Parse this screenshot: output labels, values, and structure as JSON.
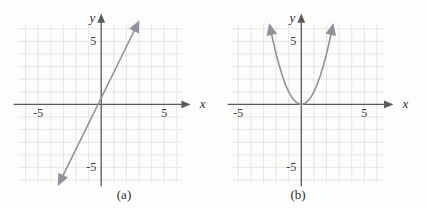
{
  "colors": {
    "background": "#fdfdfc",
    "grid": "#e4e7e3",
    "axis": "#5a5a5a",
    "curve": "#90939a",
    "text": "#3a3a3a"
  },
  "chart_data": [
    {
      "type": "line",
      "caption": "(a)",
      "title": "",
      "xlabel": "x",
      "ylabel": "y",
      "xlim": [
        -6.6,
        6.4
      ],
      "ylim": [
        -6.2,
        6.3
      ],
      "xticks": [
        -5,
        5
      ],
      "yticks": [
        5,
        -5
      ],
      "grid": true,
      "legend": "none",
      "arrows": "both-ends",
      "approx_equation": "y = 2x + 0.5",
      "points": [
        [
          -3.35,
          -6.3
        ],
        [
          2.95,
          6.5
        ]
      ]
    },
    {
      "type": "line",
      "curve_shape": "parabola",
      "caption": "(b)",
      "title": "",
      "xlabel": "x",
      "ylabel": "y",
      "xlim": [
        -5.5,
        6.6
      ],
      "ylim": [
        -6.2,
        6.3
      ],
      "xticks": [
        -5,
        5
      ],
      "yticks": [
        5,
        -5
      ],
      "grid": true,
      "legend": "none",
      "arrows": "both-ends",
      "approx_equation": "y = x^2",
      "points": [
        [
          -2.5,
          6.25
        ],
        [
          -2.25,
          5.06
        ],
        [
          -2,
          4
        ],
        [
          -1.75,
          3.06
        ],
        [
          -1.5,
          2.25
        ],
        [
          -1.25,
          1.56
        ],
        [
          -1,
          1
        ],
        [
          -0.75,
          0.56
        ],
        [
          -0.5,
          0.25
        ],
        [
          -0.25,
          0.06
        ],
        [
          0,
          0
        ],
        [
          0.25,
          0.06
        ],
        [
          0.5,
          0.25
        ],
        [
          0.75,
          0.56
        ],
        [
          1,
          1
        ],
        [
          1.25,
          1.56
        ],
        [
          1.5,
          2.25
        ],
        [
          1.75,
          3.06
        ],
        [
          2,
          4
        ],
        [
          2.25,
          5.06
        ],
        [
          2.5,
          6.25
        ]
      ]
    }
  ]
}
